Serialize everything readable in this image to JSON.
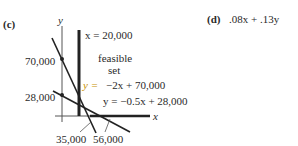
{
  "part_c": {
    "label": "(c)",
    "axes": {
      "x_label": "x",
      "y_label": "y"
    },
    "y_ticks": [
      "70,000",
      "28,000"
    ],
    "x_ticks": [
      "35,000",
      "56,000"
    ],
    "lines": [
      {
        "id": "vertical",
        "equation": "x = 20,000"
      },
      {
        "id": "line1",
        "equation_lhs": "y =",
        "equation_rhs": "−2x + 70,000"
      },
      {
        "id": "line2",
        "equation": "y = −0.5x + 28,000"
      }
    ],
    "region_label_1": "feasible",
    "region_label_2": "set",
    "colors": {
      "ink": "#2a2a2a",
      "highlight": "#e8a000"
    }
  },
  "part_d": {
    "label": "(d)",
    "expression": ".08x + .13y"
  }
}
